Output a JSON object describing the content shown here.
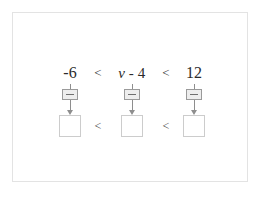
{
  "canvas": {
    "width": 264,
    "height": 202,
    "background": "#ffffff",
    "frame_border_color": "#e3e3e3"
  },
  "problem": {
    "type": "compound-inequality-solver",
    "expression_text": "-6 < v - 4 < 12",
    "expression": {
      "left_bound": "-6",
      "relation_left": "<",
      "middle_term_variable": "v",
      "middle_term_operator": "-",
      "middle_term_constant": "4",
      "relation_right": "<",
      "right_bound": "12"
    },
    "steppers": [
      {
        "label": "+",
        "glyph": "plus-in-box"
      },
      {
        "label": "+",
        "glyph": "plus-in-box"
      },
      {
        "label": "+",
        "glyph": "plus-in-box"
      }
    ],
    "answers": {
      "relation_left": "<",
      "relation_right": "<",
      "boxes": [
        {
          "value": "",
          "placeholder": ""
        },
        {
          "value": "",
          "placeholder": ""
        },
        {
          "value": "",
          "placeholder": ""
        }
      ]
    }
  },
  "colors": {
    "text": "#2b2b2b",
    "relation": "#3a3a3a",
    "arrow": "#8e8e8e",
    "stepper_border": "#9a9a9a",
    "stepper_fill": "#ededed",
    "answer_border": "#cccccc"
  }
}
